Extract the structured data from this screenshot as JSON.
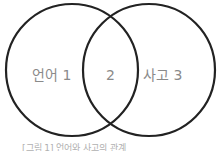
{
  "diagram": {
    "type": "venn",
    "stroke_color": "#222222",
    "text_color": "#8a8a8a",
    "sets": [
      {
        "name": "언어",
        "number": "1",
        "label": "언어  1"
      },
      {
        "name": "사고",
        "number": "3",
        "label": "사고  3"
      }
    ],
    "intersection": {
      "number": "2",
      "label": "2"
    },
    "caption": "[그림 1] 언어와 사고의 관계"
  }
}
